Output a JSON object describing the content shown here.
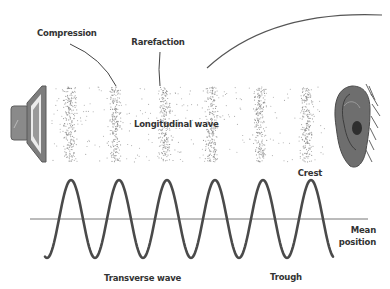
{
  "labels": {
    "compression": "Compression",
    "rarefaction": "Rarefaction",
    "longitudinal": "Longitudinal wave",
    "crest": "Crest",
    "mean_line1": "Mean",
    "mean_line2": "position",
    "transverse": "Transverse wave",
    "trough": "Trough"
  },
  "icons": {
    "source": "speaker-icon",
    "receiver": "ear-icon"
  },
  "colors": {
    "ink": "#333333",
    "wave": "#4a4a4a",
    "axis": "#777777",
    "dots": "#8a8a8a",
    "speaker": "#7a7a7a",
    "ear": "#6e6e6e"
  },
  "longitudinal_wave": {
    "compression_centers_x": [
      70,
      115,
      165,
      212,
      260,
      307
    ],
    "band_top_y": 87,
    "band_bottom_y": 162
  },
  "transverse_wave": {
    "mean_y": 219,
    "amplitude": 39,
    "period": 48,
    "start_x": 45,
    "end_x": 333,
    "crest_x": [
      71,
      118,
      167,
      215,
      263,
      310
    ],
    "trough_x": [
      95,
      142,
      190,
      237,
      285
    ]
  }
}
